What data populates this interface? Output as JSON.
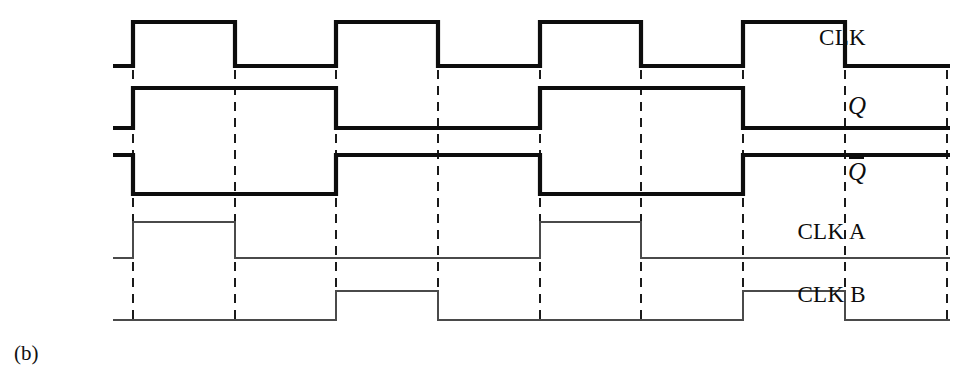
{
  "figure": {
    "caption": "(b)",
    "width": 979,
    "height": 382,
    "background": "#ffffff"
  },
  "style": {
    "bold_trace_color": "#0d0d0d",
    "bold_trace_width": 4.2,
    "thin_trace_color": "#4a4a4a",
    "thin_trace_width": 2.0,
    "dash_color": "#1a1a1a",
    "dash_width": 2.0,
    "dash_pattern": "9,7"
  },
  "labels": {
    "clk": "CLK",
    "q": "Q",
    "qbar": "Q",
    "clk_a": "CLK A",
    "clk_b": "CLK B"
  },
  "axis": {
    "trace_start_x": 113,
    "trace_end_x": 950,
    "edge_positions": [
      133,
      235,
      336,
      438,
      540,
      641,
      743,
      845,
      947
    ],
    "dash_top_y": 70,
    "dash_bottom_y": 325
  },
  "chart_data": {
    "type": "line",
    "title": "(b)",
    "xlabel": "",
    "ylabel": "",
    "time_axis": {
      "start": 113,
      "end": 950,
      "edges": [
        133,
        235,
        336,
        438,
        540,
        641,
        743,
        845,
        947
      ]
    },
    "series": [
      {
        "name": "CLK",
        "style": "bold",
        "high_y": 22,
        "low_y": 66,
        "initial_level": "low",
        "transitions": [
          133,
          235,
          336,
          438,
          540,
          641,
          743,
          845
        ],
        "levels": [
          "low",
          "high",
          "low",
          "high",
          "low",
          "high",
          "low",
          "high",
          "low"
        ]
      },
      {
        "name": "Q",
        "style": "bold",
        "high_y": 88,
        "low_y": 128,
        "initial_level": "low",
        "transitions": [
          133,
          336,
          540,
          743
        ],
        "levels": [
          "low",
          "high",
          "low",
          "high",
          "low"
        ]
      },
      {
        "name": "Qbar",
        "style": "bold",
        "high_y": 155,
        "low_y": 194,
        "initial_level": "high",
        "transitions": [
          133,
          336,
          540,
          743
        ],
        "levels": [
          "high",
          "low",
          "high",
          "low",
          "high"
        ]
      },
      {
        "name": "CLK A",
        "style": "thin",
        "high_y": 222,
        "low_y": 258,
        "initial_level": "low",
        "transitions": [
          133,
          235,
          540,
          641
        ],
        "levels": [
          "low",
          "high",
          "low",
          "high",
          "low"
        ]
      },
      {
        "name": "CLK B",
        "style": "thin",
        "high_y": 291,
        "low_y": 320,
        "initial_level": "low",
        "transitions": [
          336,
          438,
          743,
          845
        ],
        "levels": [
          "low",
          "high",
          "low",
          "high",
          "low"
        ]
      }
    ]
  },
  "label_positions": {
    "clk": {
      "right": 866,
      "top": 26
    },
    "q": {
      "right": 866,
      "top": 93
    },
    "qbar": {
      "right": 866,
      "top": 157
    },
    "clk_a": {
      "right": 866,
      "top": 220
    },
    "clk_b": {
      "right": 866,
      "top": 283
    }
  },
  "caption_position": {
    "left": 14,
    "top": 341
  }
}
